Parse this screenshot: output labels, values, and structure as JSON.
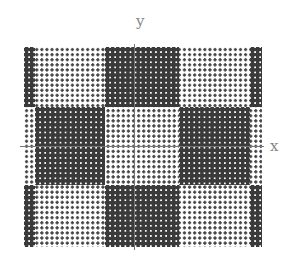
{
  "axes": {
    "x_label": "x",
    "y_label": "y"
  },
  "pattern": {
    "type": "dot-grid checkerboard",
    "dot_spacing_px": 5.1,
    "light_dot_color": "#444444",
    "dark_fill_color": "#3a3a3a",
    "dark_blocks": [
      {
        "name": "top-left-strip",
        "x": 0,
        "y": 0,
        "w": 11,
        "h": 60
      },
      {
        "name": "top-middle",
        "x": 81,
        "y": 0,
        "w": 74,
        "h": 60
      },
      {
        "name": "top-right-strip",
        "x": 226,
        "y": 0,
        "w": 12,
        "h": 60
      },
      {
        "name": "middle-left",
        "x": 11,
        "y": 60,
        "w": 70,
        "h": 78
      },
      {
        "name": "middle-right",
        "x": 155,
        "y": 60,
        "w": 71,
        "h": 78
      },
      {
        "name": "bottom-left-strip",
        "x": 0,
        "y": 138,
        "w": 11,
        "h": 62
      },
      {
        "name": "bottom-middle",
        "x": 81,
        "y": 138,
        "w": 74,
        "h": 62
      },
      {
        "name": "bottom-right-strip",
        "x": 226,
        "y": 138,
        "w": 12,
        "h": 62
      }
    ]
  }
}
